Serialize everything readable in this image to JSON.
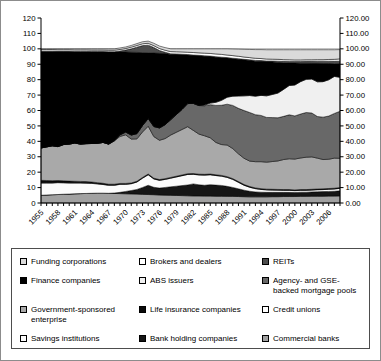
{
  "figure_title": "",
  "axis_colors": {
    "axis_line": "#000000",
    "tick_label": "#000000",
    "gridline_100": "#a6a6a6"
  },
  "chart_data": {
    "type": "area",
    "stacked": true,
    "title": "",
    "xlabel": "",
    "ylabel": "",
    "ylim": [
      0,
      120
    ],
    "grid": "single line at 100",
    "legend_position": "bottom-box, 3 columns, reverse stack order",
    "x_years": [
      1955,
      1956,
      1957,
      1958,
      1959,
      1960,
      1961,
      1962,
      1963,
      1964,
      1965,
      1966,
      1967,
      1968,
      1969,
      1970,
      1971,
      1972,
      1973,
      1974,
      1975,
      1976,
      1977,
      1978,
      1979,
      1980,
      1981,
      1982,
      1983,
      1984,
      1985,
      1986,
      1987,
      1988,
      1989,
      1990,
      1991,
      1992,
      1993,
      1994,
      1995,
      1996,
      1997,
      1998,
      1999,
      2000,
      2001,
      2002,
      2003,
      2004,
      2005,
      2006,
      2007,
      2008
    ],
    "x_tick_labels": [
      "1955",
      "1958",
      "1961",
      "1964",
      "1967",
      "1970",
      "1973",
      "1976",
      "1979",
      "1982",
      "1985",
      "1988",
      "1991",
      "1994",
      "1997",
      "2000",
      "2003",
      "2006"
    ],
    "y_left_tick_labels": [
      "0",
      "10",
      "20",
      "30",
      "40",
      "50",
      "60",
      "70",
      "80",
      "90",
      "100",
      "110",
      "120"
    ],
    "y_right_tick_labels": [
      "0.00",
      "10.00",
      "20.00",
      "30.00",
      "40.00",
      "50.00",
      "60.00",
      "70.00",
      "80.00",
      "90.00",
      "100.00",
      "110.00",
      "120.00"
    ],
    "series": [
      {
        "name": "commercial-banks",
        "label": "Commercial banks",
        "color": "#a1a1a1",
        "values": [
          5.0,
          5.2,
          5.4,
          5.5,
          5.7,
          5.8,
          6.0,
          6.1,
          6.2,
          6.3,
          6.4,
          6.4,
          6.3,
          6.2,
          6.1,
          6.0,
          5.9,
          5.8,
          5.6,
          5.5,
          5.4,
          5.2,
          5.1,
          5.0,
          4.9,
          4.8,
          4.7,
          4.6,
          4.6,
          4.5,
          4.5,
          4.4,
          4.4,
          4.3,
          4.3,
          4.2,
          4.1,
          4.0,
          4.0,
          4.0,
          4.0,
          4.1,
          4.1,
          4.2,
          4.2,
          4.2,
          4.3,
          4.3,
          4.4,
          4.4,
          4.4,
          4.5,
          4.5,
          4.6
        ]
      },
      {
        "name": "bank-holding-companies",
        "label": "Bank holding companies",
        "color": "#151515",
        "values": [
          0,
          0,
          0,
          0,
          0,
          0,
          0,
          0,
          0,
          0,
          0,
          0,
          0,
          0.3,
          0.8,
          1.5,
          2.2,
          3.0,
          4.5,
          6.0,
          4.8,
          4.5,
          5.0,
          5.5,
          6.0,
          6.5,
          7.0,
          7.8,
          7.2,
          7.0,
          7.4,
          7.2,
          7.0,
          6.5,
          5.8,
          5.0,
          4.2,
          3.6,
          3.2,
          3.0,
          2.9,
          2.8,
          2.8,
          2.7,
          2.7,
          2.6,
          2.7,
          2.7,
          2.8,
          2.9,
          3.0,
          3.0,
          3.1,
          3.3
        ]
      },
      {
        "name": "savings-institutions",
        "label": "Savings institutions",
        "color": "#fbfbfb",
        "values": [
          8.0,
          7.8,
          7.6,
          7.7,
          7.4,
          7.2,
          7.0,
          6.9,
          6.7,
          6.4,
          6.0,
          5.6,
          5.2,
          5.0,
          5.2,
          4.6,
          4.4,
          4.8,
          6.0,
          6.8,
          5.4,
          5.0,
          5.2,
          5.6,
          6.0,
          6.4,
          6.8,
          6.2,
          6.4,
          6.6,
          6.4,
          6.2,
          6.0,
          5.8,
          5.2,
          4.2,
          3.2,
          2.6,
          2.1,
          1.8,
          1.6,
          1.5,
          1.4,
          1.3,
          1.3,
          1.2,
          1.2,
          1.2,
          1.2,
          1.3,
          1.3,
          1.4,
          1.5,
          1.6
        ]
      },
      {
        "name": "credit-unions",
        "label": "Credit unions",
        "color": "#ffffff",
        "values": [
          0.2,
          0.2,
          0.2,
          0.2,
          0.2,
          0.2,
          0.2,
          0.2,
          0.2,
          0.2,
          0.2,
          0.2,
          0.2,
          0.2,
          0.2,
          0.2,
          0.2,
          0.2,
          0.2,
          0.2,
          0.2,
          0.2,
          0.2,
          0.2,
          0.2,
          0.2,
          0.2,
          0.2,
          0.2,
          0.2,
          0.2,
          0.2,
          0.2,
          0.2,
          0.2,
          0.2,
          0.2,
          0.2,
          0.2,
          0.2,
          0.2,
          0.2,
          0.2,
          0.2,
          0.2,
          0.2,
          0.2,
          0.2,
          0.2,
          0.2,
          0.2,
          0.2,
          0.2,
          0.2
        ]
      },
      {
        "name": "life-insurance-companies",
        "label": "Life insurance companies",
        "color": "#0a0a0a",
        "values": [
          1.5,
          1.4,
          1.3,
          1.2,
          1.1,
          1.0,
          0.9,
          0.8,
          0.8,
          0.7,
          0.6,
          0.6,
          0.5,
          0.5,
          0.4,
          0.4,
          0.3,
          0.3,
          0.3,
          0.3,
          0.3,
          0.3,
          0.3,
          0.3,
          0.3,
          0.3,
          0.3,
          0.3,
          0.3,
          0.3,
          0.3,
          0.3,
          0.3,
          0.3,
          0.3,
          0.3,
          0.3,
          0.3,
          0.3,
          0.3,
          0.3,
          0.3,
          0.3,
          0.3,
          0.3,
          0.3,
          0.3,
          0.3,
          0.3,
          0.3,
          0.3,
          0.3,
          0.3,
          0.3
        ]
      },
      {
        "name": "government-sponsored-enterprise",
        "label": "Government-sponsored enterprise",
        "color": "#a9a9a9",
        "values": [
          21.0,
          21.8,
          22.6,
          22.0,
          23.5,
          24.0,
          24.8,
          24.2,
          24.6,
          25.0,
          25.5,
          26.5,
          26.0,
          28.0,
          30.5,
          31.5,
          28.5,
          27.5,
          29.5,
          31.0,
          27.0,
          25.5,
          26.0,
          27.5,
          28.5,
          29.5,
          30.5,
          28.0,
          26.0,
          25.0,
          23.5,
          21.0,
          20.0,
          20.5,
          19.5,
          18.0,
          17.0,
          16.5,
          17.0,
          17.5,
          17.5,
          18.0,
          18.5,
          19.5,
          20.0,
          20.0,
          20.5,
          21.0,
          21.0,
          20.0,
          19.0,
          19.0,
          19.5,
          19.0
        ]
      },
      {
        "name": "agency-gse-backed-mortgage-pools",
        "label": "Agency- and GSE-backed mortgage pools",
        "color": "#686868",
        "values": [
          0,
          0,
          0,
          0,
          0,
          0,
          0,
          0,
          0,
          0,
          0,
          0,
          0,
          0.4,
          1.0,
          1.8,
          2.6,
          3.4,
          4.2,
          5.0,
          6.5,
          8.0,
          9.0,
          10.0,
          11.5,
          13.0,
          15.0,
          17.5,
          18.5,
          19.5,
          21.5,
          24.0,
          25.5,
          26.5,
          28.0,
          29.5,
          31.0,
          31.5,
          30.5,
          30.0,
          29.0,
          28.5,
          28.0,
          28.0,
          28.5,
          28.0,
          28.5,
          29.0,
          28.5,
          27.0,
          27.5,
          28.0,
          29.0,
          30.5
        ]
      },
      {
        "name": "abs-issuers",
        "label": "ABS issuers",
        "color": "#f0f0f0",
        "values": [
          0,
          0,
          0,
          0,
          0,
          0,
          0,
          0,
          0,
          0,
          0,
          0,
          0,
          0,
          0,
          0,
          0,
          0,
          0,
          0,
          0,
          0,
          0,
          0,
          0,
          0,
          0,
          0,
          0,
          0.4,
          1.0,
          2.0,
          3.2,
          4.5,
          6.0,
          8.0,
          9.5,
          11.0,
          12.0,
          13.0,
          14.0,
          15.0,
          16.0,
          17.5,
          19.0,
          20.0,
          21.0,
          21.5,
          22.0,
          22.5,
          23.0,
          23.5,
          24.0,
          22.0
        ]
      },
      {
        "name": "finance-companies",
        "label": "Finance companies",
        "color": "#000000",
        "values": [
          62.8,
          62.1,
          61.4,
          61.8,
          60.5,
          60.2,
          59.4,
          60.1,
          59.8,
          59.6,
          59.5,
          58.9,
          59.9,
          57.3,
          53.8,
          52.0,
          53.7,
          52.7,
          47.2,
          42.6,
          47.7,
          48.4,
          46.2,
          42.2,
          38.9,
          35.4,
          31.5,
          31.1,
          32.3,
          31.7,
          30.2,
          29.3,
          27.7,
          25.4,
          24.3,
          23.9,
          23.4,
          22.8,
          22.7,
          22.1,
          22.1,
          21.1,
          19.9,
          17.2,
          14.6,
          14.3,
          12.0,
          10.5,
          10.2,
          12.0,
          11.8,
          10.6,
          8.2,
          8.9
        ]
      },
      {
        "name": "reits",
        "label": "REITs",
        "color": "#4d4d4d",
        "values": [
          0,
          0,
          0,
          0,
          0,
          0,
          0,
          0,
          0,
          0,
          0,
          0,
          0,
          0.2,
          0.6,
          1.2,
          2.2,
          3.4,
          4.6,
          5.0,
          3.6,
          1.8,
          0.8,
          0.5,
          0.4,
          0.4,
          0.3,
          0.3,
          0.3,
          0.3,
          0.3,
          0.3,
          0.3,
          0.3,
          0.3,
          0.3,
          0.3,
          0.4,
          0.5,
          0.5,
          0.5,
          0.6,
          0.8,
          1.0,
          1.0,
          1.0,
          1.1,
          1.2,
          1.3,
          1.4,
          1.5,
          1.5,
          1.6,
          1.6
        ]
      },
      {
        "name": "brokers-and-dealers",
        "label": "Brokers and dealers",
        "color": "#ffffff",
        "values": [
          1.0,
          1.0,
          1.0,
          1.0,
          1.0,
          1.0,
          1.0,
          1.0,
          1.0,
          1.0,
          1.0,
          1.0,
          1.0,
          1.0,
          1.0,
          1.0,
          1.1,
          1.1,
          1.2,
          1.2,
          1.2,
          1.3,
          1.3,
          1.4,
          1.4,
          1.5,
          1.5,
          1.6,
          1.6,
          1.7,
          1.7,
          1.8,
          1.8,
          1.7,
          1.7,
          1.6,
          1.5,
          1.4,
          1.4,
          1.3,
          1.3,
          1.2,
          1.2,
          1.1,
          1.1,
          1.0,
          1.0,
          1.0,
          1.0,
          1.0,
          1.0,
          1.1,
          1.3,
          1.5
        ]
      },
      {
        "name": "funding-corporations",
        "label": "Funding corporations",
        "color": "#dadada",
        "values": [
          0.5,
          0.5,
          0.5,
          0.6,
          0.6,
          0.6,
          0.7,
          0.7,
          0.7,
          0.8,
          0.8,
          0.8,
          0.9,
          0.9,
          1.0,
          1.0,
          1.1,
          1.2,
          1.3,
          1.4,
          1.5,
          1.6,
          1.7,
          1.8,
          1.9,
          2.0,
          2.2,
          2.4,
          2.6,
          2.8,
          3.0,
          3.3,
          3.6,
          4.0,
          4.3,
          4.6,
          5.0,
          5.3,
          5.6,
          5.8,
          6.0,
          6.1,
          6.2,
          6.4,
          6.5,
          6.6,
          6.6,
          6.5,
          6.5,
          6.4,
          6.4,
          6.3,
          6.2,
          6.0
        ]
      }
    ]
  }
}
